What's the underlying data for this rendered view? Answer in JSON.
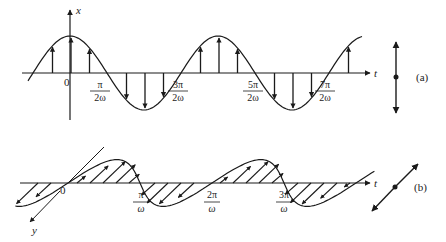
{
  "figure": {
    "panel_a": {
      "tag": "(a)",
      "vertical_axis_label": "x",
      "horizontal_axis_label": "t",
      "origin_label": "0",
      "ticks": [
        {
          "num": "π",
          "den": "2ω"
        },
        {
          "num": "3π",
          "den": "2ω"
        },
        {
          "num": "5π",
          "den": "2ω"
        },
        {
          "num": "7π",
          "den": "2ω"
        }
      ],
      "polarization_symbol": "vertical-double-arrow"
    },
    "panel_b": {
      "tag": "(b)",
      "depth_axis_label": "y",
      "horizontal_axis_label": "t",
      "origin_label": "0",
      "ticks": [
        {
          "num": "π",
          "den": "ω"
        },
        {
          "num": "2π",
          "den": "ω"
        },
        {
          "num": "3π",
          "den": "ω"
        }
      ],
      "polarization_symbol": "diagonal-double-arrow"
    }
  },
  "colors": {
    "ink": "#1a1a1a",
    "background": "#ffffff"
  }
}
